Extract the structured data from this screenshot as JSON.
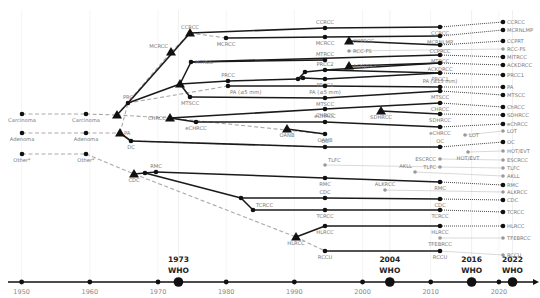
{
  "timeline": {
    "x_domain": [
      1948,
      2025
    ],
    "x_pixels": [
      8,
      533
    ],
    "axis_y": 282,
    "years": [
      1950,
      1960,
      1970,
      1980,
      1990,
      2000,
      2010,
      2020
    ],
    "who_editions": [
      {
        "year": 1973,
        "title": "1973",
        "subtitle": "WHO"
      },
      {
        "year": 2004,
        "title": "2004",
        "subtitle": "WHO"
      },
      {
        "year": 2016,
        "title": "2016",
        "subtitle": "WHO"
      },
      {
        "year": 2022,
        "title": "2022",
        "subtitle": "WHO"
      }
    ]
  },
  "legend_note": "Other* (asterisk-marked category)",
  "nodes": [
    {
      "id": "carc50",
      "label": "Carcinoma",
      "x": 22,
      "y": 114,
      "shape": "dot",
      "label_pos": "below"
    },
    {
      "id": "aden50",
      "label": "Adenoma",
      "x": 22,
      "y": 133,
      "shape": "dot",
      "label_pos": "below"
    },
    {
      "id": "other50",
      "label": "Other*",
      "x": 22,
      "y": 154,
      "shape": "dot",
      "label_pos": "below"
    },
    {
      "id": "carc73",
      "label": "Carcinoma",
      "x": 86,
      "y": 114,
      "shape": "dot",
      "label_pos": "below"
    },
    {
      "id": "aden73",
      "label": "Adenoma",
      "x": 86,
      "y": 133,
      "shape": "dot",
      "label_pos": "below"
    },
    {
      "id": "other73",
      "label": "Other*",
      "x": 86,
      "y": 154,
      "shape": "dot",
      "label_pos": "below"
    },
    {
      "id": "carcTri",
      "label": "",
      "x": 117,
      "y": 115,
      "shape": "tri"
    },
    {
      "id": "prc",
      "label": "PRC",
      "x": 128,
      "y": 103,
      "shape": "dot",
      "label_pos": "above"
    },
    {
      "id": "paTri",
      "label": "PA",
      "x": 120,
      "y": 133,
      "shape": "tri",
      "label_pos": "right"
    },
    {
      "id": "dc78",
      "label": "DC",
      "x": 131,
      "y": 141,
      "shape": "dot",
      "label_pos": "below"
    },
    {
      "id": "mcrccTri",
      "label": "MCRCC",
      "x": 171,
      "y": 52,
      "shape": "tri",
      "label_pos": "above-left"
    },
    {
      "id": "ccrccTri",
      "label": "CCRCC",
      "x": 190,
      "y": 33,
      "shape": "tri",
      "label_pos": "above"
    },
    {
      "id": "mcrcc86",
      "label": "MCRCC",
      "x": 226,
      "y": 38,
      "shape": "dot",
      "label_pos": "below"
    },
    {
      "id": "chrccTri",
      "label": "CHRCC",
      "x": 170,
      "y": 118,
      "shape": "tri",
      "label_pos": "left"
    },
    {
      "id": "echrcc86",
      "label": "eCHRCC",
      "x": 196,
      "y": 122,
      "shape": "dot",
      "label_pos": "below"
    },
    {
      "id": "papTri",
      "label": "",
      "x": 180,
      "y": 84,
      "shape": "tri"
    },
    {
      "id": "mtrcc86",
      "label": "MTRCC",
      "x": 191,
      "y": 62,
      "shape": "dot",
      "label_pos": "right"
    },
    {
      "id": "mtscc86",
      "label": "MTSCC",
      "x": 190,
      "y": 97,
      "shape": "dot",
      "label_pos": "below"
    },
    {
      "id": "prcc92",
      "label": "PRCC",
      "x": 228,
      "y": 81,
      "shape": "dot",
      "label_pos": "above"
    },
    {
      "id": "pa92",
      "label": "PA (≤5 mm)",
      "x": 228,
      "y": 86,
      "shape": "dot",
      "label_pos": "below-right"
    },
    {
      "id": "cdcTri",
      "label": "CDC",
      "x": 134,
      "y": 174,
      "shape": "tri",
      "label_pos": "below"
    },
    {
      "id": "cdcA",
      "label": "",
      "x": 145,
      "y": 173,
      "shape": "dot"
    },
    {
      "id": "rmc",
      "label": "RMC",
      "x": 156,
      "y": 172,
      "shape": "dot",
      "label_pos": "above"
    },
    {
      "id": "tcKnee",
      "label": "",
      "x": 241,
      "y": 198,
      "shape": "dot"
    },
    {
      "id": "tcrcc96",
      "label": "TCRCC",
      "x": 253,
      "y": 210,
      "shape": "dot",
      "label_pos": "above-right"
    },
    {
      "id": "oanbTri",
      "label": "OANB",
      "x": 287,
      "y": 129,
      "shape": "tri",
      "label_pos": "below"
    },
    {
      "id": "hlrccTri",
      "label": "HLRCC",
      "x": 296,
      "y": 237,
      "shape": "tri",
      "label_pos": "below"
    },
    {
      "id": "pKnee1",
      "label": "",
      "x": 298,
      "y": 79,
      "shape": "dot"
    },
    {
      "id": "pKnee2",
      "label": "",
      "x": 305,
      "y": 72,
      "shape": "dot"
    },
    {
      "id": "pKnee3",
      "label": "",
      "x": 303,
      "y": 78,
      "shape": "dot"
    },
    {
      "id": "c04_ccrcc",
      "label": "CCRCC",
      "x": 325,
      "y": 28,
      "shape": "dot",
      "label_pos": "above"
    },
    {
      "id": "c04_mcrcc",
      "label": "MCRCC",
      "x": 325,
      "y": 37,
      "shape": "dot",
      "label_pos": "below"
    },
    {
      "id": "c04_mtrcc",
      "label": "MTRCC",
      "x": 325,
      "y": 60,
      "shape": "dot",
      "label_pos": "above"
    },
    {
      "id": "c04_prcc2",
      "label": "PRCC2",
      "x": 325,
      "y": 70,
      "shape": "dot",
      "label_pos": "above"
    },
    {
      "id": "c04_prcc1",
      "label": "PRCC1",
      "x": 325,
      "y": 79,
      "shape": "dot",
      "label_pos": "below"
    },
    {
      "id": "c04_pa",
      "label": "PA (≤5 mm)",
      "x": 325,
      "y": 86,
      "shape": "dot",
      "label_pos": "below"
    },
    {
      "id": "c04_mtscc",
      "label": "MTSCC",
      "x": 325,
      "y": 98,
      "shape": "dot",
      "label_pos": "below"
    },
    {
      "id": "c04_chrcc",
      "label": "CHRCC",
      "x": 325,
      "y": 109,
      "shape": "dot",
      "label_pos": "below"
    },
    {
      "id": "c04_echrcc",
      "label": "eCHRCC",
      "x": 325,
      "y": 122,
      "shape": "dot",
      "label_pos": "above"
    },
    {
      "id": "c04_oanb",
      "label": "OANB",
      "x": 325,
      "y": 134,
      "shape": "dot",
      "label_pos": "below"
    },
    {
      "id": "c04_oc",
      "label": "OC",
      "x": 325,
      "y": 147,
      "shape": "dot",
      "label_pos": "above"
    },
    {
      "id": "c04_tlfc",
      "label": "TLFC",
      "x": 325,
      "y": 165,
      "shape": "gdot",
      "label_pos": "above-right"
    },
    {
      "id": "c04_rmc",
      "label": "RMC",
      "x": 325,
      "y": 178,
      "shape": "dot",
      "label_pos": "below"
    },
    {
      "id": "c04_cdc",
      "label": "CDC",
      "x": 325,
      "y": 198,
      "shape": "dot",
      "label_pos": "above"
    },
    {
      "id": "c04_tcrcc",
      "label": "TCRCC",
      "x": 325,
      "y": 210,
      "shape": "dot",
      "label_pos": "below"
    },
    {
      "id": "c04_hlrcc",
      "label": "HLRCC",
      "x": 325,
      "y": 226,
      "shape": "dot",
      "label_pos": "below"
    },
    {
      "id": "c04_rccu",
      "label": "RCCU",
      "x": 325,
      "y": 251,
      "shape": "dot",
      "label_pos": "below"
    },
    {
      "id": "ccprccTri",
      "label": "CCPRCC",
      "x": 349,
      "y": 41,
      "shape": "tri",
      "label_pos": "right"
    },
    {
      "id": "rccfs",
      "label": "RCC-FS",
      "x": 349,
      "y": 51,
      "shape": "gdot",
      "label_pos": "right"
    },
    {
      "id": "acdTri",
      "label": "ACKDRCC",
      "x": 349,
      "y": 66,
      "shape": "tri",
      "label_pos": "right"
    },
    {
      "id": "sdhTri",
      "label": "SDHRCC",
      "x": 381,
      "y": 111,
      "shape": "tri",
      "label_pos": "below"
    },
    {
      "id": "akll",
      "label": "AKLL",
      "x": 415,
      "y": 172,
      "shape": "gdot",
      "label_pos": "above-left"
    },
    {
      "id": "alkrcc",
      "label": "ALKRCC",
      "x": 385,
      "y": 190,
      "shape": "gdot",
      "label_pos": "above"
    },
    {
      "id": "lot",
      "label": "LOT",
      "x": 465,
      "y": 135,
      "shape": "gdot",
      "label_pos": "right"
    },
    {
      "id": "hotevt",
      "label": "HOT/EVT",
      "x": 468,
      "y": 152,
      "shape": "gdot",
      "label_pos": "below"
    },
    {
      "id": "c16_ccrcc",
      "label": "CCRCC",
      "x": 440,
      "y": 27,
      "shape": "dot",
      "label_pos": "below"
    },
    {
      "id": "c16_mcrnlmp",
      "label": "MCRNLMP",
      "x": 440,
      "y": 36,
      "shape": "dot",
      "label_pos": "below"
    },
    {
      "id": "c16_ccprcc",
      "label": "CCPRCC",
      "x": 440,
      "y": 45,
      "shape": "dot",
      "label_pos": "below"
    },
    {
      "id": "c16_mtrcc",
      "label": "MTRCC",
      "x": 440,
      "y": 55,
      "shape": "dot",
      "label_pos": "below"
    },
    {
      "id": "c16_ackd",
      "label": "ACKDRCC",
      "x": 440,
      "y": 63,
      "shape": "dot",
      "label_pos": "below"
    },
    {
      "id": "c16_prcc1",
      "label": "PRCC1",
      "x": 440,
      "y": 73,
      "shape": "dot",
      "label_pos": "below"
    },
    {
      "id": "c16_pa",
      "label": "PA (≤15 mm)",
      "x": 440,
      "y": 87,
      "shape": "dot",
      "label_pos": "above"
    },
    {
      "id": "c16_mtscc",
      "label": "MTSCC",
      "x": 440,
      "y": 91,
      "shape": "dot",
      "label_pos": "below"
    },
    {
      "id": "c16_chrcc",
      "label": "CHRCC",
      "x": 440,
      "y": 103,
      "shape": "dot",
      "label_pos": "below"
    },
    {
      "id": "c16_sdh",
      "label": "SDHRCC",
      "x": 440,
      "y": 114,
      "shape": "dot",
      "label_pos": "below"
    },
    {
      "id": "c16_echrcc",
      "label": "eCHRCC",
      "x": 440,
      "y": 127,
      "shape": "dot",
      "label_pos": "below"
    },
    {
      "id": "c16_oc",
      "label": "OC",
      "x": 440,
      "y": 147,
      "shape": "dot",
      "label_pos": "above"
    },
    {
      "id": "c16_escrcc",
      "label": "ESCRCC",
      "x": 440,
      "y": 159,
      "shape": "gdot",
      "label_pos": "left"
    },
    {
      "id": "c16_tlfc",
      "label": "TLFC",
      "x": 440,
      "y": 167,
      "shape": "gdot",
      "label_pos": "left"
    },
    {
      "id": "c16_rmc",
      "label": "RMC",
      "x": 440,
      "y": 182,
      "shape": "dot",
      "label_pos": "below"
    },
    {
      "id": "c16_cdc",
      "label": "CDC",
      "x": 440,
      "y": 199,
      "shape": "dot",
      "label_pos": "below"
    },
    {
      "id": "c16_tcrcc",
      "label": "TCRCC",
      "x": 440,
      "y": 210,
      "shape": "dot",
      "label_pos": "below"
    },
    {
      "id": "c16_hlrcc",
      "label": "HLRCC",
      "x": 440,
      "y": 226,
      "shape": "dot",
      "label_pos": "below"
    },
    {
      "id": "c16_tfeb",
      "label": "TFEBRCC",
      "x": 440,
      "y": 238,
      "shape": "gdot",
      "label_pos": "below"
    },
    {
      "id": "c16_rccu",
      "label": "RCCU",
      "x": 440,
      "y": 251,
      "shape": "dot",
      "label_pos": "below"
    },
    {
      "id": "c22_ccrcc",
      "label": "CCRCC",
      "x": 503,
      "y": 22,
      "shape": "dot",
      "label_pos": "right"
    },
    {
      "id": "c22_mcrnlmp",
      "label": "MCRNLMP",
      "x": 503,
      "y": 30,
      "shape": "dot",
      "label_pos": "right"
    },
    {
      "id": "c22_ccprt",
      "label": "CCPRT",
      "x": 503,
      "y": 41,
      "shape": "dot",
      "label_pos": "right"
    },
    {
      "id": "c22_rccfs",
      "label": "RCC-FS",
      "x": 503,
      "y": 49,
      "shape": "gdot",
      "label_pos": "right"
    },
    {
      "id": "c22_mtrcc",
      "label": "MITRCC",
      "x": 503,
      "y": 57,
      "shape": "dot",
      "label_pos": "right"
    },
    {
      "id": "c22_ackd",
      "label": "ACKDRCC",
      "x": 503,
      "y": 65,
      "shape": "dot",
      "label_pos": "right"
    },
    {
      "id": "c22_prcc1",
      "label": "PRCC1",
      "x": 503,
      "y": 75,
      "shape": "dot",
      "label_pos": "right"
    },
    {
      "id": "c22_pa",
      "label": "PA",
      "x": 503,
      "y": 87,
      "shape": "dot",
      "label_pos": "right"
    },
    {
      "id": "c22_mtscc",
      "label": "MTSCC",
      "x": 503,
      "y": 95,
      "shape": "dot",
      "label_pos": "right"
    },
    {
      "id": "c22_chrcc",
      "label": "ChRCC",
      "x": 503,
      "y": 107,
      "shape": "dot",
      "label_pos": "right"
    },
    {
      "id": "c22_sdh",
      "label": "SDHRCC",
      "x": 503,
      "y": 115,
      "shape": "dot",
      "label_pos": "right"
    },
    {
      "id": "c22_echrcc",
      "label": "eChRCC",
      "x": 503,
      "y": 124,
      "shape": "dot",
      "label_pos": "right"
    },
    {
      "id": "c22_lot",
      "label": "LOT",
      "x": 503,
      "y": 131,
      "shape": "gdot",
      "label_pos": "right"
    },
    {
      "id": "c22_oc",
      "label": "OC",
      "x": 503,
      "y": 142,
      "shape": "dot",
      "label_pos": "right"
    },
    {
      "id": "c22_hotevt",
      "label": "HOT/EVT",
      "x": 503,
      "y": 151,
      "shape": "gdot",
      "label_pos": "right"
    },
    {
      "id": "c22_escrcc",
      "label": "ESCRCC",
      "x": 503,
      "y": 160,
      "shape": "gdot",
      "label_pos": "right"
    },
    {
      "id": "c22_tlfc",
      "label": "TLFC",
      "x": 503,
      "y": 168,
      "shape": "gdot",
      "label_pos": "right"
    },
    {
      "id": "c22_akll",
      "label": "AKLL",
      "x": 503,
      "y": 176,
      "shape": "gdot",
      "label_pos": "right"
    },
    {
      "id": "c22_rmc",
      "label": "RMC",
      "x": 503,
      "y": 185,
      "shape": "dot",
      "label_pos": "right"
    },
    {
      "id": "c22_alkrcc",
      "label": "ALKRCC",
      "x": 503,
      "y": 192,
      "shape": "gdot",
      "label_pos": "right"
    },
    {
      "id": "c22_cdc",
      "label": "CDC",
      "x": 503,
      "y": 200,
      "shape": "dot",
      "label_pos": "right"
    },
    {
      "id": "c22_tcrcc",
      "label": "TCRCC",
      "x": 503,
      "y": 212,
      "shape": "dot",
      "label_pos": "right"
    },
    {
      "id": "c22_hlrcc",
      "label": "HLRCC",
      "x": 503,
      "y": 226,
      "shape": "dot",
      "label_pos": "right"
    },
    {
      "id": "c22_tfeb",
      "label": "TFEBRCC",
      "x": 503,
      "y": 238,
      "shape": "gdot",
      "label_pos": "right"
    },
    {
      "id": "c22_rccu",
      "label": "RCCU",
      "x": 503,
      "y": 255,
      "shape": "gdot",
      "label_pos": "right"
    }
  ],
  "edges": {
    "solid": [
      [
        "carcTri",
        "prc"
      ],
      [
        "prc",
        "ccrccTri"
      ],
      [
        "ccrccTri",
        "c04_ccrcc"
      ],
      [
        "c04_ccrcc",
        "c16_ccrcc"
      ],
      [
        "prc",
        "papTri"
      ],
      [
        "papTri",
        "mtrcc86"
      ],
      [
        "papTri",
        "mtscc86"
      ],
      [
        "papTri",
        "prcc92"
      ],
      [
        "mtrcc86",
        "c04_mtrcc"
      ],
      [
        "mtrcc86",
        "c16_mtrcc"
      ],
      [
        "mtscc86",
        "c04_mtscc"
      ],
      [
        "c04_mtscc",
        "c16_mtscc"
      ],
      [
        "prcc92",
        "pKnee1"
      ],
      [
        "pKnee1",
        "pKnee2"
      ],
      [
        "pKnee2",
        "c04_prcc2"
      ],
      [
        "pKnee1",
        "pKnee3"
      ],
      [
        "pKnee3",
        "c04_prcc1"
      ],
      [
        "pa92",
        "c04_pa"
      ],
      [
        "c04_pa",
        "c16_pa"
      ],
      [
        "c04_prcc1",
        "c16_prcc1"
      ],
      [
        "c04_prcc2",
        "c16_ackd"
      ],
      [
        "mcrcc86",
        "c04_mcrcc"
      ],
      [
        "c04_mcrcc",
        "c16_mcrnlmp"
      ],
      [
        "chrccTri",
        "c04_chrcc"
      ],
      [
        "c04_chrcc",
        "c16_chrcc"
      ],
      [
        "chrccTri",
        "echrcc86"
      ],
      [
        "echrcc86",
        "c04_echrcc"
      ],
      [
        "c04_echrcc",
        "c16_echrcc"
      ],
      [
        "sdhTri",
        "c16_sdh"
      ],
      [
        "ccprccTri",
        "c16_ccprcc"
      ],
      [
        "acdTri",
        "c16_ackd"
      ],
      [
        "oanbTri",
        "c04_oanb"
      ],
      [
        "paTri",
        "dc78"
      ],
      [
        "dc78",
        "c04_oc"
      ],
      [
        "c04_oc",
        "c16_oc"
      ],
      [
        "cdcTri",
        "cdcA"
      ],
      [
        "cdcA",
        "rmc"
      ],
      [
        "rmc",
        "c04_rmc"
      ],
      [
        "c04_rmc",
        "c16_rmc"
      ],
      [
        "cdcA",
        "tcKnee"
      ],
      [
        "tcKnee",
        "c04_cdc"
      ],
      [
        "c04_cdc",
        "c16_cdc"
      ],
      [
        "tcKnee",
        "tcrcc96"
      ],
      [
        "tcrcc96",
        "c04_tcrcc"
      ],
      [
        "c04_tcrcc",
        "c16_tcrcc"
      ],
      [
        "c04_hlrcc",
        "hlrccTri"
      ],
      [
        "c04_hlrcc",
        "c16_hlrcc"
      ],
      [
        "c04_rccu",
        "c16_rccu"
      ],
      [
        "c04_prcc2",
        "c16_prcc1"
      ]
    ],
    "dashed": [
      [
        "carc50",
        "carc73"
      ],
      [
        "carc73",
        "carcTri"
      ],
      [
        "aden50",
        "aden73"
      ],
      [
        "aden73",
        "paTri"
      ],
      [
        "other50",
        "other73"
      ],
      [
        "other73",
        "cdcTri"
      ],
      [
        "carcTri",
        "mcrccTri"
      ],
      [
        "mcrccTri",
        "ccrccTri"
      ],
      [
        "ccrccTri",
        "mcrcc86"
      ],
      [
        "prc",
        "pa92"
      ],
      [
        "carcTri",
        "chrccTri"
      ],
      [
        "paTri",
        "prc"
      ],
      [
        "dc78",
        "c04_oc"
      ],
      [
        "cdcTri",
        "hlrccTri"
      ],
      [
        "hlrccTri",
        "c04_rccu"
      ],
      [
        "chrccTri",
        "c04_oanb"
      ]
    ],
    "dotted_2016_2022": [
      [
        "c16_ccrcc",
        "c22_ccrcc"
      ],
      [
        "c16_mcrnlmp",
        "c22_mcrnlmp"
      ],
      [
        "c16_ccprcc",
        "c22_ccprt"
      ],
      [
        "c16_mtrcc",
        "c22_mtrcc"
      ],
      [
        "c16_ackd",
        "c22_ackd"
      ],
      [
        "c16_prcc1",
        "c22_prcc1"
      ],
      [
        "c16_pa",
        "c22_pa"
      ],
      [
        "c16_mtscc",
        "c22_mtscc"
      ],
      [
        "c16_chrcc",
        "c22_chrcc"
      ],
      [
        "c16_sdh",
        "c22_sdh"
      ],
      [
        "c16_echrcc",
        "c22_echrcc"
      ],
      [
        "c16_oc",
        "c22_oc"
      ],
      [
        "c16_rmc",
        "c22_rmc"
      ],
      [
        "c16_cdc",
        "c22_cdc"
      ],
      [
        "c16_tcrcc",
        "c22_tcrcc"
      ],
      [
        "c16_hlrcc",
        "c22_hlrcc"
      ]
    ],
    "grey": [
      [
        "rccfs",
        "c22_rccfs"
      ],
      [
        "c04_tlfc",
        "c16_tlfc"
      ],
      [
        "c16_tlfc",
        "c22_tlfc"
      ],
      [
        "c16_escrcc",
        "c22_escrcc"
      ],
      [
        "akll",
        "c22_akll"
      ],
      [
        "alkrcc",
        "c22_alkrcc"
      ],
      [
        "lot",
        "c22_lot"
      ],
      [
        "hotevt",
        "c22_hotevt"
      ],
      [
        "c16_tfeb",
        "c22_tfeb"
      ],
      [
        "c16_rccu",
        "c22_rccu"
      ]
    ]
  },
  "colors": {
    "solid": "#1a1a1a",
    "dashed": "#aaaaaa",
    "grey_node": "#999999",
    "gridline": "#eeeeee"
  }
}
